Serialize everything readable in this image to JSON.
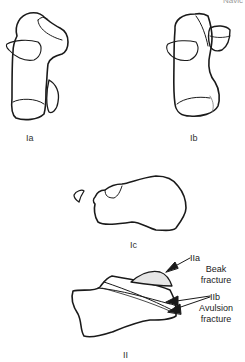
{
  "figure": {
    "corner_text": "Navic",
    "panels": [
      {
        "id": "Ia",
        "label": "Ia"
      },
      {
        "id": "Ib",
        "label": "Ib"
      },
      {
        "id": "Ic",
        "label": "Ic"
      },
      {
        "id": "II",
        "label": "II"
      }
    ],
    "annotations": {
      "IIa": {
        "code": "IIa",
        "line1": "Beak",
        "line2": "fracture"
      },
      "IIb": {
        "code": "IIb",
        "line1": "Avulsion",
        "line2": "fracture"
      }
    },
    "colors": {
      "stroke": "#1a1a1a",
      "thin": "#555555",
      "fragment_fill": "#e6e6e6"
    }
  }
}
